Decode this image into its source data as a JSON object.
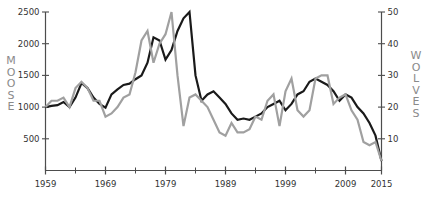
{
  "chart_data": {
    "type": "line",
    "title": "",
    "subtitle": "",
    "xlabel": "",
    "grid": false,
    "legend": "none",
    "x_axis": {
      "label": "",
      "ticks": [
        1959,
        1969,
        1979,
        1989,
        1999,
        2009,
        2015
      ],
      "tick_labels": [
        "1959",
        "1969",
        "1979",
        "1989",
        "1999",
        "2009",
        "2015"
      ],
      "minor_ticks": [
        1964,
        1974,
        1984,
        1994,
        2004
      ],
      "xlim": [
        1959,
        2015
      ]
    },
    "y_axis_left": {
      "label": "MOOSE",
      "ticks": [
        500,
        1000,
        1500,
        2000,
        2500
      ],
      "tick_labels": [
        "500",
        "1000",
        "1500",
        "2000",
        "2500"
      ],
      "ylim": [
        0,
        2500
      ],
      "color": "#1a1a1a"
    },
    "y_axis_right": {
      "label": "WOLVES",
      "ticks": [
        10,
        20,
        30,
        40,
        50
      ],
      "tick_labels": [
        "10",
        "20",
        "30",
        "40",
        "50"
      ],
      "ylim": [
        0,
        50
      ],
      "color": "#999999"
    },
    "series": [
      {
        "name": "MOOSE",
        "axis": "left",
        "color": "#1a1a1a",
        "linewidth": 2.2,
        "x": [
          1959,
          1960,
          1961,
          1962,
          1963,
          1964,
          1965,
          1966,
          1967,
          1968,
          1969,
          1970,
          1971,
          1972,
          1973,
          1974,
          1975,
          1976,
          1977,
          1978,
          1979,
          1980,
          1981,
          1982,
          1983,
          1984,
          1985,
          1986,
          1987,
          1988,
          1989,
          1990,
          1991,
          1992,
          1993,
          1994,
          1995,
          1996,
          1997,
          1998,
          1999,
          2000,
          2001,
          2002,
          2003,
          2004,
          2005,
          2006,
          2007,
          2008,
          2009,
          2010,
          2011,
          2012,
          2013,
          2014,
          2015
        ],
        "values": [
          1000,
          1020,
          1030,
          1080,
          1000,
          1150,
          1380,
          1300,
          1150,
          1050,
          990,
          1200,
          1280,
          1350,
          1370,
          1440,
          1500,
          1700,
          2100,
          2050,
          1750,
          1900,
          2200,
          2400,
          2500,
          1500,
          1100,
          1200,
          1250,
          1150,
          1050,
          900,
          800,
          820,
          800,
          850,
          900,
          1000,
          1050,
          1100,
          950,
          1050,
          1200,
          1250,
          1400,
          1450,
          1400,
          1350,
          1250,
          1100,
          1200,
          1150,
          1000,
          900,
          750,
          550,
          150
        ]
      },
      {
        "name": "WOLVES",
        "axis": "right",
        "color": "#a0a0a0",
        "linewidth": 2.2,
        "x": [
          1959,
          1960,
          1961,
          1962,
          1963,
          1964,
          1965,
          1966,
          1967,
          1968,
          1969,
          1970,
          1971,
          1972,
          1973,
          1974,
          1975,
          1976,
          1977,
          1978,
          1979,
          1980,
          1981,
          1982,
          1983,
          1984,
          1985,
          1986,
          1987,
          1988,
          1989,
          1990,
          1991,
          1992,
          1993,
          1994,
          1995,
          1996,
          1997,
          1998,
          1999,
          2000,
          2001,
          2002,
          2003,
          2004,
          2005,
          2006,
          2007,
          2008,
          2009,
          2010,
          2011,
          2012,
          2013,
          2014,
          2015
        ],
        "values": [
          20,
          22,
          22,
          23,
          20,
          26,
          28,
          26,
          22,
          22,
          17,
          18,
          20,
          23,
          24,
          31,
          41,
          44,
          34,
          40,
          43,
          50,
          30,
          14,
          23,
          24,
          22,
          20,
          16,
          12,
          11,
          15,
          12,
          12,
          13,
          17,
          16,
          22,
          24,
          14,
          25,
          29,
          19,
          17,
          19,
          29,
          30,
          30,
          21,
          23,
          24,
          19,
          16,
          9,
          8,
          9,
          3
        ]
      }
    ],
    "note": "Isle Royale moose and wolf populations 1959-2015"
  },
  "axis_labels": {
    "left_vertical": "MOOSE",
    "right_vertical": "WOLVES"
  }
}
